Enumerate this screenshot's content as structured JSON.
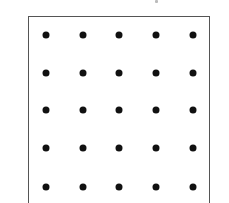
{
  "diagram": {
    "type": "dot-grid",
    "rows": 5,
    "cols": 5,
    "dot_color": "#111111",
    "border_color": "#555555",
    "col_x": [
      46,
      83,
      119,
      156,
      193
    ],
    "row_y": [
      35,
      73,
      110,
      148,
      187
    ]
  }
}
